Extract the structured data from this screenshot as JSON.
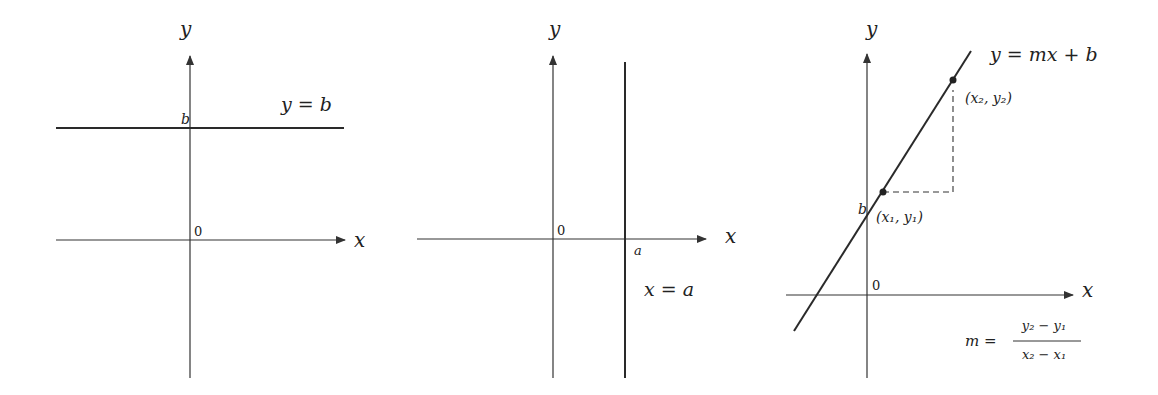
{
  "panels": [
    {
      "id": "horizontal-line",
      "axis_x_label": "x",
      "axis_y_label": "y",
      "origin_label": "0",
      "intercept_label": "b",
      "equation": "y = b"
    },
    {
      "id": "vertical-line",
      "axis_x_label": "x",
      "axis_y_label": "y",
      "origin_label": "0",
      "intercept_label": "a",
      "equation": "x = a"
    },
    {
      "id": "slope-intercept-line",
      "axis_x_label": "x",
      "axis_y_label": "y",
      "origin_label": "0",
      "intercept_label": "b",
      "equation": "y = mx + b",
      "point1_label": "(x₁, y₁)",
      "point2_label": "(x₂, y₂)",
      "slope_lhs": "m =",
      "slope_numerator": "y₂ − y₁",
      "slope_denominator": "x₂ − x₁"
    }
  ],
  "colors": {
    "ink": "#2a2a2a",
    "background": "#ffffff"
  }
}
